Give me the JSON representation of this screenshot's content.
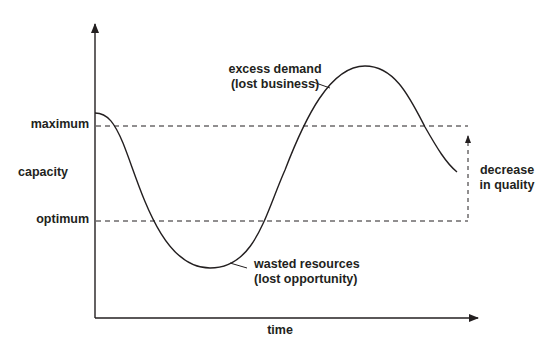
{
  "diagram": {
    "y_axis_label": "capacity",
    "x_axis_label": "time",
    "reference_lines": {
      "maximum": "maximum",
      "optimum": "optimum"
    },
    "annotations": {
      "excess_demand_line1": "excess demand",
      "excess_demand_line2": "(lost business)",
      "wasted_resources_line1": "wasted resources",
      "wasted_resources_line2": "(lost opportunity)",
      "decrease_line1": "decrease",
      "decrease_line2": "in quality"
    },
    "colors": {
      "ink": "#231f20",
      "background": "#ffffff"
    }
  }
}
